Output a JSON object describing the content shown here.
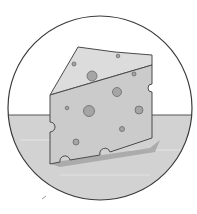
{
  "illustration": {
    "subject": "cheese-wedge",
    "style": "grayscale pencil drawing in circular frame",
    "colors": {
      "background": "#ffffff",
      "outline": "#4a4a4a",
      "table": "#d4d4d4",
      "cheese_top": "#d8d8d8",
      "cheese_front": "#c9c9c9",
      "holes": "#a8a8a8",
      "shadow": "#9a9a9a"
    }
  }
}
